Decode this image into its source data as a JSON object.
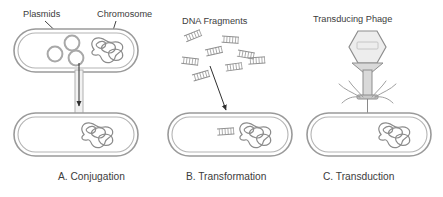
{
  "figure": {
    "labels": {
      "plasmids": "Plasmids",
      "chromosome": "Chromosome",
      "dna_fragments": "DNA Fragments",
      "transducing_phage": "Transducing Phage"
    },
    "captions": {
      "a": "A. Conjugation",
      "b": "B. Transformation",
      "c": "C. Transduction"
    },
    "colors": {
      "background": "#ffffff",
      "text": "#3c3c3c",
      "cell_wall_outer": "#9a9a9a",
      "cell_wall_inner": "#b4b4b4",
      "cell_wall_band": "#e9e9e9",
      "plasmid_stroke": "#a8a8a8",
      "chromosome_stroke": "#8c8c8c",
      "fragment_stroke": "#8f8f8f",
      "phage_head_fill": "#ededed",
      "phage_head_stroke": "#8d8d8d",
      "arrow": "#2f2f2f"
    },
    "panels": [
      {
        "id": "conjugation",
        "caption": "A. Conjugation",
        "donor_cell": {
          "plasmid_count": 3,
          "has_chromosome": true
        },
        "recipient_cell": {
          "has_chromosome": true
        },
        "connector": "conjugation-pilus-tube",
        "transfer_direction": "donor-to-recipient"
      },
      {
        "id": "transformation",
        "caption": "B. Transformation",
        "free_fragment_count": 8,
        "recipient_cell": {
          "has_chromosome": true,
          "internalized_fragments": 1
        },
        "transfer_direction": "environment-to-recipient"
      },
      {
        "id": "transduction",
        "caption": "C. Transduction",
        "vector": "bacteriophage",
        "phage_parts": [
          "head",
          "tail",
          "baseplate",
          "tail-fibers"
        ],
        "phage_leg_count": 6,
        "recipient_cell": {
          "has_chromosome": true
        },
        "transfer_direction": "phage-to-recipient"
      }
    ]
  }
}
